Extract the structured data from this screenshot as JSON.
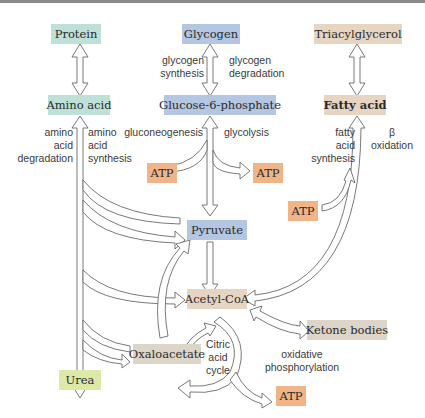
{
  "colors": {
    "teal": "#bfe0d6",
    "blue": "#b4c6e2",
    "tan": "#e6d5c2",
    "orange": "#f0b487",
    "green": "#dde9a6",
    "greige": "#ddd5c8"
  },
  "nodes": {
    "protein": "Protein",
    "glycogen": "Glycogen",
    "triacylglycerol": "Triacylglycerol",
    "amino_acid": "Amino acid",
    "glucose6p": "Glucose-6-phosphate",
    "fatty_acid": "Fatty acid",
    "atp_left": "ATP",
    "atp_right": "ATP",
    "atp_fatty": "ATP",
    "pyruvate": "Pyruvate",
    "acetyl_coa": "Acetyl-CoA",
    "ketone_bodies": "Ketone bodies",
    "oxaloacetate": "Oxaloacetate",
    "urea": "Urea",
    "atp_bottom": "ATP"
  },
  "labels": {
    "glycogen_synthesis": [
      "glycogen",
      "synthesis"
    ],
    "glycogen_degradation": [
      "glycogen",
      "degradation"
    ],
    "amino_acid_degradation": [
      "amino",
      "acid",
      "degradation"
    ],
    "amino_acid_synthesis": [
      "amino",
      "acid",
      "synthesis"
    ],
    "gluconeogenesis": "gluconeogenesis",
    "glycolysis": "glycolysis",
    "fatty_acid_synthesis": [
      "fatty",
      "acid",
      "synthesis"
    ],
    "beta_oxidation": [
      "β",
      "oxidation"
    ],
    "citric_acid_cycle": [
      "Citric",
      "acid",
      "cycle"
    ],
    "oxidative_phosphorylation": [
      "oxidative",
      "phosphorylation"
    ]
  }
}
